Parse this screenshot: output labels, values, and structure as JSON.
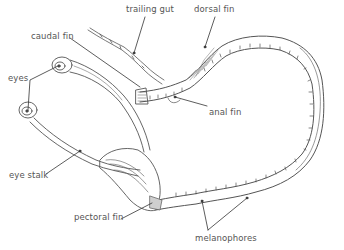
{
  "diagram": {
    "colors": {
      "line": "#555555",
      "fill": "#ffffff",
      "label": "#555555",
      "hatch": "#8a8a8a"
    },
    "labels": [
      {
        "id": "trailing-gut",
        "text": "trailing gut",
        "x": 126,
        "y": 11
      },
      {
        "id": "dorsal-fin",
        "text": "dorsal fin",
        "x": 194,
        "y": 11
      },
      {
        "id": "caudal-fin",
        "text": "caudal fin",
        "x": 31,
        "y": 32
      },
      {
        "id": "eyes",
        "text": "eyes",
        "x": 8,
        "y": 74
      },
      {
        "id": "anal-fin",
        "text": "anal fin",
        "x": 209,
        "y": 108
      },
      {
        "id": "eye-stalk",
        "text": "eye stalk",
        "x": 9,
        "y": 171
      },
      {
        "id": "pectoral-fin",
        "text": "pectoral fin",
        "x": 74,
        "y": 213
      },
      {
        "id": "melanophores",
        "text": "melanophores",
        "x": 195,
        "y": 235
      }
    ]
  }
}
